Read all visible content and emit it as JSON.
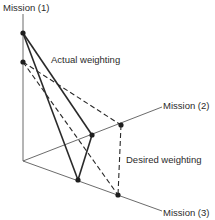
{
  "diagram": {
    "axes": [
      {
        "id": "m1",
        "label": "Mission (1)"
      },
      {
        "id": "m2",
        "label": "Mission (2)"
      },
      {
        "id": "m3",
        "label": "Mission (3)"
      }
    ],
    "series": [
      {
        "name": "Actual weighting",
        "style": "solid"
      },
      {
        "name": "Desired weighting",
        "style": "dashed"
      }
    ],
    "colors": {
      "line": "#2a2a2a",
      "axis": "#5a5a5a",
      "background": "#ffffff"
    }
  }
}
